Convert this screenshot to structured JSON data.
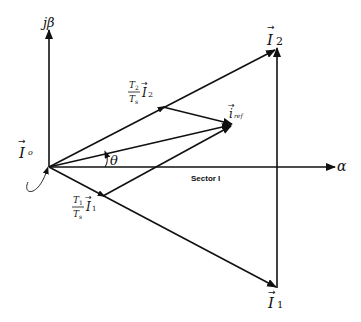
{
  "diagram": {
    "type": "space-vector-diagram",
    "axes": {
      "beta_label": "jβ",
      "alpha_label": "α"
    },
    "vectors": {
      "I0": {
        "label": "I",
        "sub": "o"
      },
      "I1": {
        "label": "I",
        "sub": "1"
      },
      "I2": {
        "label": "I",
        "sub": "2"
      },
      "iref": {
        "label": "i",
        "sub": "ref"
      }
    },
    "components": {
      "t1": {
        "num": "T",
        "num_sub": "1",
        "den": "T",
        "den_sub": "s",
        "vec": "I",
        "vec_sub": "1"
      },
      "t2": {
        "num": "T",
        "num_sub": "2",
        "den": "T",
        "den_sub": "s",
        "vec": "I",
        "vec_sub": "2"
      }
    },
    "angle_label": "θ",
    "sector_label": "Sector I",
    "colors": {
      "stroke": "#111111",
      "background": "#ffffff"
    }
  }
}
